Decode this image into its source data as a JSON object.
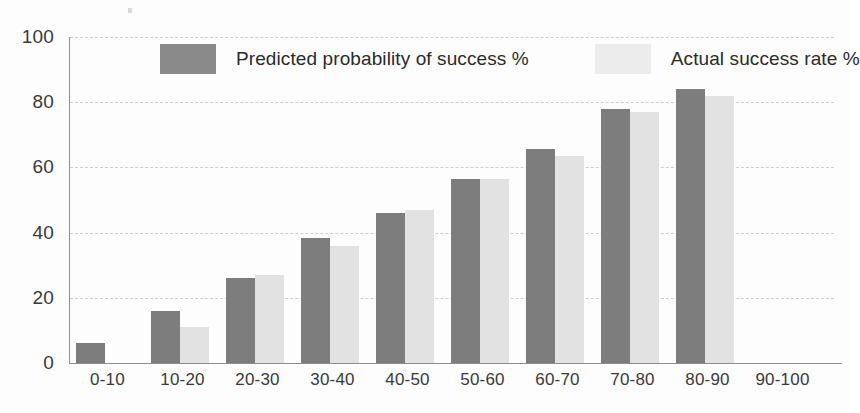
{
  "chart_data": {
    "type": "bar",
    "title": "",
    "xlabel": "",
    "ylabel": "",
    "ylim": [
      0,
      100
    ],
    "yticks": [
      0,
      20,
      40,
      60,
      80,
      100
    ],
    "grid": true,
    "legend_position": "top-center",
    "categories": [
      "0-10",
      "10-20",
      "20-30",
      "30-40",
      "40-50",
      "50-60",
      "60-70",
      "70-80",
      "80-90",
      "90-100"
    ],
    "series": [
      {
        "name": "Predicted probability of success %",
        "color": "#7d7d7d",
        "values": [
          6,
          16,
          26,
          38.5,
          46,
          56.5,
          65.5,
          78,
          84,
          null
        ]
      },
      {
        "name": "Actual success rate %",
        "color": "#e2e2e2",
        "values": [
          null,
          11,
          27,
          36,
          47,
          56.5,
          63.5,
          77,
          82,
          null
        ]
      }
    ]
  },
  "legend": {
    "items": [
      {
        "label": "Predicted probability of success %",
        "color": "#8a8a8a"
      },
      {
        "label": "Actual success rate %",
        "color": "#ececec"
      }
    ]
  },
  "axes": {
    "y_tick_labels": [
      "0",
      "20",
      "40",
      "60",
      "80",
      "100"
    ],
    "x_tick_labels": [
      "0-10",
      "10-20",
      "20-30",
      "30-40",
      "40-50",
      "50-60",
      "60-70",
      "70-80",
      "80-90",
      "90-100"
    ]
  }
}
